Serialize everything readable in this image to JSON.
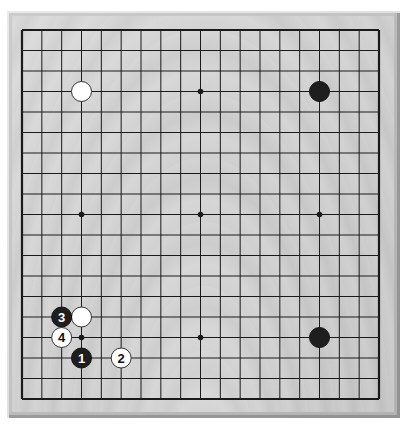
{
  "board": {
    "size": 19,
    "grid_left": 22,
    "grid_top": 30,
    "grid_right": 379,
    "grid_bottom": 399,
    "colors": {
      "wood": "#d3d3d3",
      "line": "#1a1a1a",
      "black_stone": "#1e1e1e",
      "white_stone": "#ffffff"
    },
    "star_points": [
      {
        "col": 3,
        "row": 3
      },
      {
        "col": 9,
        "row": 3
      },
      {
        "col": 15,
        "row": 3
      },
      {
        "col": 3,
        "row": 9
      },
      {
        "col": 9,
        "row": 9
      },
      {
        "col": 15,
        "row": 9
      },
      {
        "col": 3,
        "row": 15
      },
      {
        "col": 9,
        "row": 15
      },
      {
        "col": 15,
        "row": 15
      }
    ],
    "stones": [
      {
        "color": "white",
        "col": 3,
        "row": 3,
        "label": ""
      },
      {
        "color": "black",
        "col": 15,
        "row": 3,
        "label": ""
      },
      {
        "color": "black",
        "col": 15,
        "row": 15,
        "label": ""
      },
      {
        "color": "white",
        "col": 3,
        "row": 14,
        "label": ""
      },
      {
        "color": "black",
        "col": 2,
        "row": 14,
        "label": "3"
      },
      {
        "color": "white",
        "col": 2,
        "row": 15,
        "label": "4"
      },
      {
        "color": "black",
        "col": 3,
        "row": 16,
        "label": "1"
      },
      {
        "color": "white",
        "col": 5,
        "row": 16,
        "label": "2"
      }
    ]
  }
}
